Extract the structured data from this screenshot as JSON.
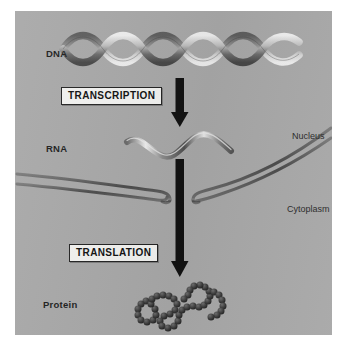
{
  "figure": {
    "panel_background": "#a8a8a8",
    "page_background": "#ffffff"
  },
  "labels": {
    "dna": "DNA",
    "rna": "RNA",
    "protein": "Protein",
    "nucleus": "Nucleus",
    "cytoplasm": "Cytoplasm"
  },
  "steps": [
    {
      "id": "transcription",
      "label": "TRANSCRIPTION"
    },
    {
      "id": "translation",
      "label": "TRANSLATION"
    }
  ],
  "colors": {
    "panel": "#a8a8a8",
    "ink": "#1d1d1d",
    "arrow": "#121212",
    "box_fill": "#f2f2f0",
    "box_border": "#232323",
    "membrane": "#5d5d5d",
    "molecule_dark": "#4a4a4a",
    "molecule_light": "#d8d8d8",
    "protein_bead": "#3b3b3b"
  },
  "diagram_elements": {
    "dna_helix": {
      "name": "dna-double-helix",
      "turns": 4,
      "style": "ribbon double helix, grayscale"
    },
    "rna_strand": {
      "name": "rna-single-strand",
      "waves": 2,
      "style": "single wavy ribbon, grayscale"
    },
    "nuclear_membrane": {
      "name": "nuclear-envelope",
      "layers": 2,
      "pore": "center gap where arrow passes"
    },
    "protein_chain": {
      "name": "folded-polypeptide",
      "style": "chain of beads forming loops"
    },
    "arrow_transcription": {
      "name": "transcription-arrow",
      "direction": "down"
    },
    "arrow_translation": {
      "name": "translation-arrow",
      "direction": "down"
    }
  }
}
